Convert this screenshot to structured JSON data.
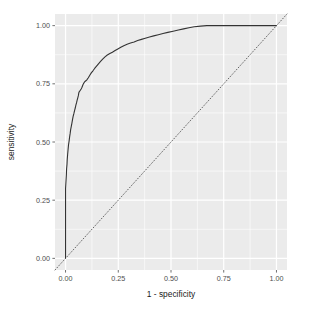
{
  "chart_data": {
    "type": "line",
    "title": "",
    "subtitle": "",
    "xlabel": "1 - specificity",
    "ylabel": "sensitivity",
    "xlim": [
      -0.05,
      1.05
    ],
    "ylim": [
      -0.05,
      1.05
    ],
    "xticks": [
      0,
      0.25,
      0.5,
      0.75,
      1
    ],
    "yticks": [
      0,
      0.25,
      0.5,
      0.75,
      1
    ],
    "xticklabels": [
      "0.00",
      "0.25",
      "0.50",
      "0.75",
      "1.00"
    ],
    "yticklabels": [
      "0.00",
      "0.25",
      "0.50",
      "0.75",
      "1.00"
    ],
    "grid": true,
    "grid_color": "#ffffff",
    "panel_background": "#ebebeb",
    "figure_background": "#ffffff",
    "legend": "none",
    "series": [
      {
        "name": "ROC curve",
        "style": "solid",
        "color": "#333333",
        "linewidth": 1.1,
        "points": [
          [
            0.0,
            0.0
          ],
          [
            0.0,
            0.055
          ],
          [
            0.0,
            0.12
          ],
          [
            0.0,
            0.185
          ],
          [
            0.0,
            0.25
          ],
          [
            0.0,
            0.3
          ],
          [
            0.002,
            0.33
          ],
          [
            0.004,
            0.36
          ],
          [
            0.005,
            0.385
          ],
          [
            0.007,
            0.405
          ],
          [
            0.008,
            0.425
          ],
          [
            0.01,
            0.447
          ],
          [
            0.012,
            0.468
          ],
          [
            0.014,
            0.487
          ],
          [
            0.017,
            0.505
          ],
          [
            0.019,
            0.52
          ],
          [
            0.022,
            0.538
          ],
          [
            0.024,
            0.552
          ],
          [
            0.027,
            0.566
          ],
          [
            0.03,
            0.58
          ],
          [
            0.033,
            0.596
          ],
          [
            0.036,
            0.61
          ],
          [
            0.04,
            0.624
          ],
          [
            0.043,
            0.636
          ],
          [
            0.046,
            0.646
          ],
          [
            0.049,
            0.658
          ],
          [
            0.052,
            0.668
          ],
          [
            0.055,
            0.68
          ],
          [
            0.058,
            0.69
          ],
          [
            0.061,
            0.7
          ],
          [
            0.063,
            0.712
          ],
          [
            0.066,
            0.718
          ],
          [
            0.07,
            0.722
          ],
          [
            0.074,
            0.728
          ],
          [
            0.078,
            0.735
          ],
          [
            0.082,
            0.745
          ],
          [
            0.086,
            0.752
          ],
          [
            0.09,
            0.758
          ],
          [
            0.095,
            0.762
          ],
          [
            0.1,
            0.766
          ],
          [
            0.108,
            0.776
          ],
          [
            0.115,
            0.787
          ],
          [
            0.122,
            0.797
          ],
          [
            0.13,
            0.806
          ],
          [
            0.138,
            0.816
          ],
          [
            0.147,
            0.826
          ],
          [
            0.156,
            0.836
          ],
          [
            0.166,
            0.846
          ],
          [
            0.176,
            0.856
          ],
          [
            0.187,
            0.866
          ],
          [
            0.198,
            0.874
          ],
          [
            0.21,
            0.88
          ],
          [
            0.222,
            0.886
          ],
          [
            0.235,
            0.893
          ],
          [
            0.248,
            0.9
          ],
          [
            0.262,
            0.907
          ],
          [
            0.276,
            0.914
          ],
          [
            0.292,
            0.92
          ],
          [
            0.308,
            0.925
          ],
          [
            0.325,
            0.93
          ],
          [
            0.342,
            0.936
          ],
          [
            0.36,
            0.941
          ],
          [
            0.378,
            0.946
          ],
          [
            0.398,
            0.951
          ],
          [
            0.418,
            0.956
          ],
          [
            0.44,
            0.961
          ],
          [
            0.462,
            0.966
          ],
          [
            0.485,
            0.971
          ],
          [
            0.51,
            0.976
          ],
          [
            0.535,
            0.981
          ],
          [
            0.56,
            0.986
          ],
          [
            0.585,
            0.991
          ],
          [
            0.61,
            0.995
          ],
          [
            0.64,
            0.998
          ],
          [
            0.67,
            1.0
          ],
          [
            0.75,
            1.0
          ],
          [
            0.85,
            1.0
          ],
          [
            1.0,
            1.0
          ]
        ]
      },
      {
        "name": "chance diagonal",
        "style": "dotted",
        "color": "#555555",
        "linewidth": 0.9,
        "points": [
          [
            -0.05,
            -0.05
          ],
          [
            1.05,
            1.05
          ]
        ]
      }
    ]
  }
}
